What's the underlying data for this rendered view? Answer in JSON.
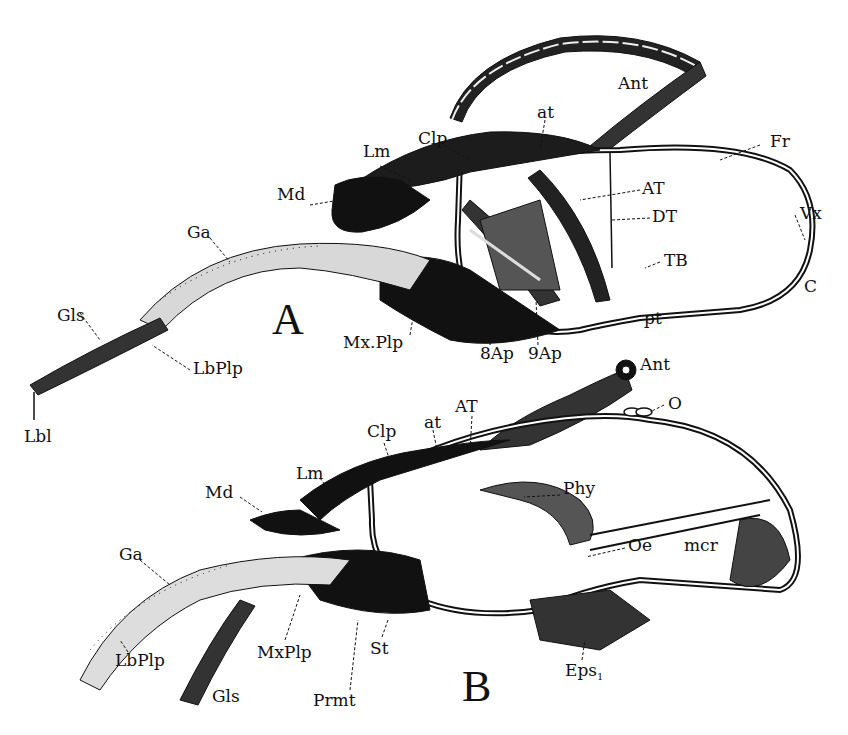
{
  "figure": {
    "panels": [
      {
        "id": "A",
        "title": "A",
        "labels": [
          {
            "text": "Ant",
            "x": 618,
            "y": 75
          },
          {
            "text": "at",
            "x": 537,
            "y": 104
          },
          {
            "text": "Clp",
            "x": 418,
            "y": 130
          },
          {
            "text": "Lm",
            "x": 363,
            "y": 143
          },
          {
            "text": "Fr",
            "x": 770,
            "y": 133
          },
          {
            "text": "Md",
            "x": 277,
            "y": 186
          },
          {
            "text": "AT",
            "x": 642,
            "y": 180
          },
          {
            "text": "DT",
            "x": 652,
            "y": 208
          },
          {
            "text": "Vx",
            "x": 800,
            "y": 205
          },
          {
            "text": "Ga",
            "x": 187,
            "y": 224
          },
          {
            "text": "TB",
            "x": 664,
            "y": 252
          },
          {
            "text": "C",
            "x": 804,
            "y": 278
          },
          {
            "text": "Gls",
            "x": 57,
            "y": 307
          },
          {
            "text": "Mx.Plp",
            "x": 343,
            "y": 334
          },
          {
            "text": "St",
            "x": 453,
            "y": 318
          },
          {
            "text": "pt",
            "x": 644,
            "y": 310
          },
          {
            "text": "8Ap",
            "x": 480,
            "y": 345
          },
          {
            "text": "9Ap",
            "x": 528,
            "y": 345
          },
          {
            "text": "LbPlp",
            "x": 193,
            "y": 367
          },
          {
            "text": "Lbl",
            "x": 24,
            "y": 433
          }
        ]
      },
      {
        "id": "B",
        "title": "B",
        "labels": [
          {
            "text": "Ant",
            "x": 636,
            "y": 361
          },
          {
            "text": "O",
            "x": 668,
            "y": 399
          },
          {
            "text": "AT",
            "x": 455,
            "y": 402
          },
          {
            "text": "at",
            "x": 424,
            "y": 417
          },
          {
            "text": "Clp",
            "x": 367,
            "y": 426
          },
          {
            "text": "Lm",
            "x": 296,
            "y": 468
          },
          {
            "text": "Phy",
            "x": 563,
            "y": 484
          },
          {
            "text": "Md",
            "x": 205,
            "y": 486
          },
          {
            "text": "Oe",
            "x": 628,
            "y": 539
          },
          {
            "text": "mcr",
            "x": 684,
            "y": 539
          },
          {
            "text": "Ga",
            "x": 119,
            "y": 550
          },
          {
            "text": "MxPlp",
            "x": 257,
            "y": 645
          },
          {
            "text": "St",
            "x": 370,
            "y": 640
          },
          {
            "text": "LbPlp",
            "x": 115,
            "y": 654
          },
          {
            "text": "Eps",
            "sub": "1",
            "x": 565,
            "y": 665
          },
          {
            "text": "Gls",
            "x": 212,
            "y": 690
          },
          {
            "text": "Prmt",
            "x": 313,
            "y": 693
          }
        ]
      }
    ],
    "panel_letters": [
      {
        "text": "A",
        "x": 272,
        "y": 300
      },
      {
        "text": "B",
        "x": 462,
        "y": 670
      }
    ],
    "colors": {
      "ink": "#111111",
      "paper": "#ffffff"
    }
  }
}
